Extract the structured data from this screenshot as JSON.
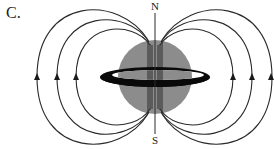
{
  "panel_label": "C.",
  "poles": {
    "north": "N",
    "south": "S"
  },
  "colors": {
    "sphere": "#8c8c8c",
    "ring": "#0a0a0a",
    "field_lines": "#2a2a2a",
    "background": "#ffffff"
  },
  "figure": {
    "sphere": {
      "cx": 155,
      "cy": 77,
      "r": 37
    },
    "ring": {
      "cx": 155,
      "cy": 77,
      "rx": 55,
      "ry": 10
    },
    "axis": {
      "x": 155,
      "y_top": 12,
      "y_bottom": 134
    },
    "field_loops_left_x": [
      37,
      57,
      76
    ],
    "field_loops_right_x": [
      233,
      252,
      272
    ],
    "arrow_direction": "up"
  }
}
